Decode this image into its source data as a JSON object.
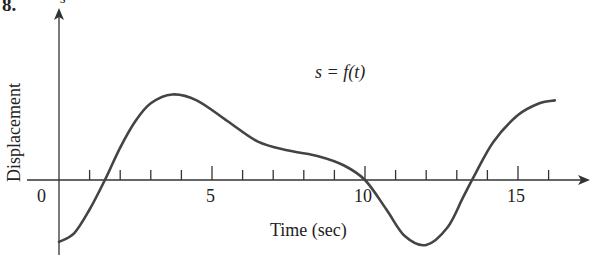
{
  "problem_number": "8.",
  "chart_data": {
    "type": "line",
    "title": "s = f(t)",
    "xlabel": "Time (sec)",
    "ylabel": "Displacement",
    "y_axis_symbol": "s",
    "x_ticks": [
      0,
      1,
      2,
      3,
      4,
      5,
      6,
      7,
      8,
      9,
      10,
      11,
      12,
      13,
      14,
      15,
      16
    ],
    "x_tick_labels": [
      "0",
      "5",
      "10",
      "15"
    ],
    "xlim": [
      0,
      17.5
    ],
    "grid": false,
    "series": [
      {
        "name": "s = f(t)",
        "x": [
          0,
          0.5,
          1,
          1.5,
          2,
          2.5,
          3,
          3.7,
          4.5,
          5.5,
          6.5,
          7.5,
          8.5,
          9.3,
          10,
          10.7,
          11.3,
          12,
          12.7,
          13.2,
          13.6,
          14.2,
          15,
          15.7,
          16.2
        ],
        "y": [
          -2.1,
          -1.8,
          -1.0,
          0,
          1.1,
          2.0,
          2.6,
          2.9,
          2.7,
          2.0,
          1.3,
          1.0,
          0.8,
          0.5,
          0,
          -1.0,
          -1.9,
          -2.2,
          -1.6,
          -0.6,
          0.2,
          1.3,
          2.2,
          2.6,
          2.7
        ]
      }
    ]
  },
  "labels": {
    "title": "s = f(t)",
    "xlabel": "Time (sec)",
    "ylabel": "Displacement",
    "y_symbol": "s",
    "tick0": "0",
    "tick5": "5",
    "tick10": "10",
    "tick15": "15"
  }
}
